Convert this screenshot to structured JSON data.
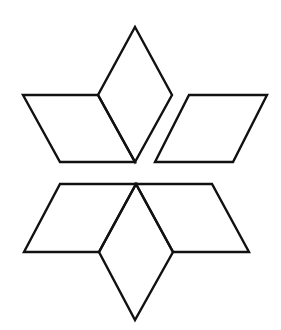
{
  "diagram": {
    "stroke_color": "#111111",
    "background_color": "#ffffff",
    "shapes": [
      {
        "name": "upper-left-rhombus",
        "points": "23,95 98,95 135,162 60,162"
      },
      {
        "name": "upper-center-rhombus",
        "points": "135,27 172,95 135,162 98,95"
      },
      {
        "name": "upper-right-rhombus",
        "points": "189,95 267,95 233,162 155,162"
      },
      {
        "name": "lower-left-rhombus",
        "points": "60,184 136,184 99,252 24,252"
      },
      {
        "name": "lower-center-rhombus",
        "points": "136,184 173,252 135,320 99,252"
      },
      {
        "name": "lower-right-rhombus",
        "points": "136,184 212,184 249,252 173,252"
      }
    ]
  }
}
